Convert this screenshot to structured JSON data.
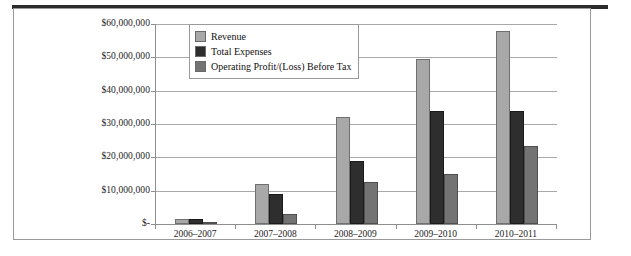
{
  "chart_data": {
    "type": "bar",
    "title": "",
    "xlabel": "",
    "ylabel": "",
    "grid": true,
    "legend_position": "top-left-inside",
    "categories": [
      "2006–2007",
      "2007–2008",
      "2008–2009",
      "2009–2010",
      "2010–2011"
    ],
    "ylim": [
      0,
      60000000
    ],
    "ytick_values": [
      0,
      10000000,
      20000000,
      30000000,
      40000000,
      50000000,
      60000000
    ],
    "ytick_labels": [
      "$-",
      "$10,000,000",
      "$20,000,000",
      "$30,000,000",
      "$40,000,000",
      "$50,000,000",
      "$60,000,000"
    ],
    "series": [
      {
        "name": "Revenue",
        "color": "#a8a8a8",
        "values": [
          1500000,
          12000000,
          32000000,
          49500000,
          58000000
        ]
      },
      {
        "name": "Total Expenses",
        "color": "#2e2e2e",
        "values": [
          1500000,
          9000000,
          19000000,
          34000000,
          34000000
        ]
      },
      {
        "name": "Operating Profit/(Loss) Before Tax",
        "color": "#737373",
        "values": [
          100000,
          3000000,
          12500000,
          15000000,
          23500000
        ]
      }
    ]
  },
  "legend": {
    "items": [
      {
        "label": "Revenue",
        "swatch": "revenue"
      },
      {
        "label": "Total Expenses",
        "swatch": "expenses"
      },
      {
        "label": "Operating Profit/(Loss) Before Tax",
        "swatch": "profit"
      }
    ]
  }
}
